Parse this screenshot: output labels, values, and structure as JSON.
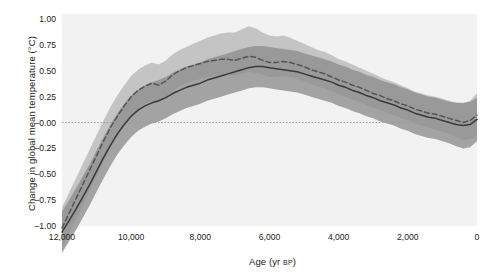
{
  "chart_data": {
    "type": "line",
    "title": "",
    "xlabel": "Age (yr BP)",
    "xlabel_main": "Age (yr ",
    "xlabel_sub": "BP",
    "xlabel_close": ")",
    "ylabel": "Change in global mean temperature (°C)",
    "xlim": [
      12000,
      0
    ],
    "ylim": [
      -1.0,
      1.0
    ],
    "x_reversed": true,
    "grid": false,
    "zero_line": true,
    "legend": "none",
    "xticks": [
      12000,
      10000,
      8000,
      6000,
      4000,
      2000,
      0
    ],
    "xticklabels": [
      "12,000",
      "10,000",
      "8,000",
      "6,000",
      "4,000",
      "2,000",
      "0"
    ],
    "yticks": [
      1.0,
      0.75,
      0.5,
      0.25,
      0.0,
      -0.25,
      -0.5,
      -0.75,
      -1.0
    ],
    "yticklabels": [
      "1.00",
      "0.75",
      "0.50",
      "0.25",
      "–0.00",
      "–0.25",
      "–0.50",
      "–0.75",
      "–1.00"
    ],
    "colors": {
      "line_lower": "#3a3a3a",
      "line_upper": "#555555",
      "band_lower": "#8f8f8f",
      "band_upper": "#b4b4b4",
      "plot_background": "#f2f2f2",
      "zero_line": "#9a9a9a",
      "text": "#1a1a1a"
    },
    "series": [
      {
        "name": "reconstruction-upper",
        "style": "dashed",
        "x": [
          12000,
          11800,
          11600,
          11400,
          11200,
          11000,
          10800,
          10600,
          10400,
          10200,
          10000,
          9800,
          9600,
          9400,
          9200,
          9000,
          8800,
          8600,
          8400,
          8200,
          8000,
          7800,
          7600,
          7400,
          7200,
          7000,
          6800,
          6600,
          6400,
          6200,
          6000,
          5800,
          5600,
          5400,
          5200,
          5000,
          4800,
          4600,
          4400,
          4200,
          4000,
          3800,
          3600,
          3400,
          3200,
          3000,
          2800,
          2600,
          2400,
          2200,
          2000,
          1800,
          1600,
          1400,
          1200,
          1000,
          800,
          600,
          400,
          200,
          0
        ],
        "values": [
          -1.02,
          -0.88,
          -0.74,
          -0.6,
          -0.46,
          -0.32,
          -0.18,
          -0.05,
          0.06,
          0.16,
          0.25,
          0.31,
          0.35,
          0.38,
          0.36,
          0.4,
          0.46,
          0.5,
          0.53,
          0.55,
          0.57,
          0.59,
          0.6,
          0.61,
          0.61,
          0.6,
          0.62,
          0.64,
          0.63,
          0.6,
          0.58,
          0.58,
          0.59,
          0.58,
          0.56,
          0.54,
          0.51,
          0.49,
          0.47,
          0.44,
          0.41,
          0.39,
          0.36,
          0.34,
          0.31,
          0.28,
          0.26,
          0.23,
          0.21,
          0.18,
          0.16,
          0.13,
          0.11,
          0.09,
          0.08,
          0.06,
          0.04,
          0.02,
          0.0,
          0.02,
          0.07
        ],
        "band_low": [
          -1.22,
          -1.08,
          -0.94,
          -0.8,
          -0.66,
          -0.52,
          -0.38,
          -0.25,
          -0.14,
          -0.04,
          0.06,
          0.13,
          0.18,
          0.21,
          0.2,
          0.25,
          0.31,
          0.35,
          0.38,
          0.4,
          0.42,
          0.44,
          0.45,
          0.46,
          0.46,
          0.45,
          0.47,
          0.49,
          0.48,
          0.46,
          0.44,
          0.44,
          0.45,
          0.44,
          0.42,
          0.4,
          0.37,
          0.35,
          0.33,
          0.3,
          0.27,
          0.25,
          0.22,
          0.2,
          0.17,
          0.14,
          0.12,
          0.09,
          0.07,
          0.04,
          0.02,
          -0.01,
          -0.03,
          -0.05,
          -0.07,
          -0.09,
          -0.11,
          -0.14,
          -0.17,
          -0.16,
          -0.13
        ],
        "band_high": [
          -0.82,
          -0.68,
          -0.54,
          -0.4,
          -0.26,
          -0.12,
          0.02,
          0.15,
          0.26,
          0.36,
          0.45,
          0.51,
          0.55,
          0.58,
          0.56,
          0.6,
          0.66,
          0.7,
          0.73,
          0.76,
          0.79,
          0.82,
          0.84,
          0.86,
          0.87,
          0.87,
          0.9,
          0.93,
          0.91,
          0.87,
          0.84,
          0.83,
          0.84,
          0.82,
          0.79,
          0.76,
          0.73,
          0.7,
          0.68,
          0.65,
          0.61,
          0.59,
          0.56,
          0.53,
          0.5,
          0.47,
          0.44,
          0.41,
          0.39,
          0.36,
          0.33,
          0.3,
          0.28,
          0.26,
          0.25,
          0.23,
          0.21,
          0.19,
          0.18,
          0.21,
          0.28
        ]
      },
      {
        "name": "reconstruction-lower",
        "style": "solid",
        "x": [
          12000,
          11800,
          11600,
          11400,
          11200,
          11000,
          10800,
          10600,
          10400,
          10200,
          10000,
          9800,
          9600,
          9400,
          9200,
          9000,
          8800,
          8600,
          8400,
          8200,
          8000,
          7800,
          7600,
          7400,
          7200,
          7000,
          6800,
          6600,
          6400,
          6200,
          6000,
          5800,
          5600,
          5400,
          5200,
          5000,
          4800,
          4600,
          4400,
          4200,
          4000,
          3800,
          3600,
          3400,
          3200,
          3000,
          2800,
          2600,
          2400,
          2200,
          2000,
          1800,
          1600,
          1400,
          1200,
          1000,
          800,
          600,
          400,
          200,
          0
        ],
        "values": [
          -1.06,
          -0.95,
          -0.84,
          -0.72,
          -0.6,
          -0.47,
          -0.34,
          -0.22,
          -0.11,
          -0.02,
          0.06,
          0.12,
          0.16,
          0.19,
          0.21,
          0.24,
          0.28,
          0.31,
          0.34,
          0.36,
          0.38,
          0.41,
          0.43,
          0.45,
          0.47,
          0.49,
          0.51,
          0.53,
          0.54,
          0.54,
          0.53,
          0.52,
          0.51,
          0.5,
          0.49,
          0.47,
          0.45,
          0.43,
          0.41,
          0.39,
          0.36,
          0.34,
          0.31,
          0.29,
          0.26,
          0.24,
          0.21,
          0.19,
          0.17,
          0.14,
          0.12,
          0.09,
          0.07,
          0.05,
          0.04,
          0.02,
          0.0,
          -0.02,
          -0.03,
          -0.02,
          0.03
        ],
        "band_low": [
          -1.26,
          -1.15,
          -1.04,
          -0.92,
          -0.8,
          -0.67,
          -0.54,
          -0.42,
          -0.31,
          -0.22,
          -0.14,
          -0.08,
          -0.04,
          -0.01,
          0.01,
          0.04,
          0.08,
          0.11,
          0.14,
          0.16,
          0.18,
          0.21,
          0.23,
          0.25,
          0.27,
          0.29,
          0.31,
          0.33,
          0.34,
          0.34,
          0.33,
          0.32,
          0.31,
          0.3,
          0.29,
          0.27,
          0.25,
          0.23,
          0.21,
          0.19,
          0.16,
          0.14,
          0.11,
          0.09,
          0.06,
          0.04,
          0.01,
          -0.01,
          -0.03,
          -0.06,
          -0.08,
          -0.11,
          -0.13,
          -0.15,
          -0.16,
          -0.18,
          -0.2,
          -0.23,
          -0.25,
          -0.24,
          -0.18
        ],
        "band_high": [
          -0.86,
          -0.75,
          -0.64,
          -0.52,
          -0.4,
          -0.27,
          -0.14,
          -0.02,
          0.09,
          0.18,
          0.26,
          0.32,
          0.36,
          0.39,
          0.41,
          0.44,
          0.48,
          0.51,
          0.54,
          0.56,
          0.58,
          0.61,
          0.63,
          0.65,
          0.67,
          0.69,
          0.71,
          0.73,
          0.74,
          0.74,
          0.73,
          0.72,
          0.71,
          0.7,
          0.69,
          0.67,
          0.65,
          0.63,
          0.61,
          0.59,
          0.56,
          0.54,
          0.51,
          0.49,
          0.46,
          0.44,
          0.41,
          0.39,
          0.37,
          0.34,
          0.32,
          0.29,
          0.27,
          0.25,
          0.24,
          0.22,
          0.2,
          0.19,
          0.19,
          0.2,
          0.24
        ]
      }
    ]
  }
}
